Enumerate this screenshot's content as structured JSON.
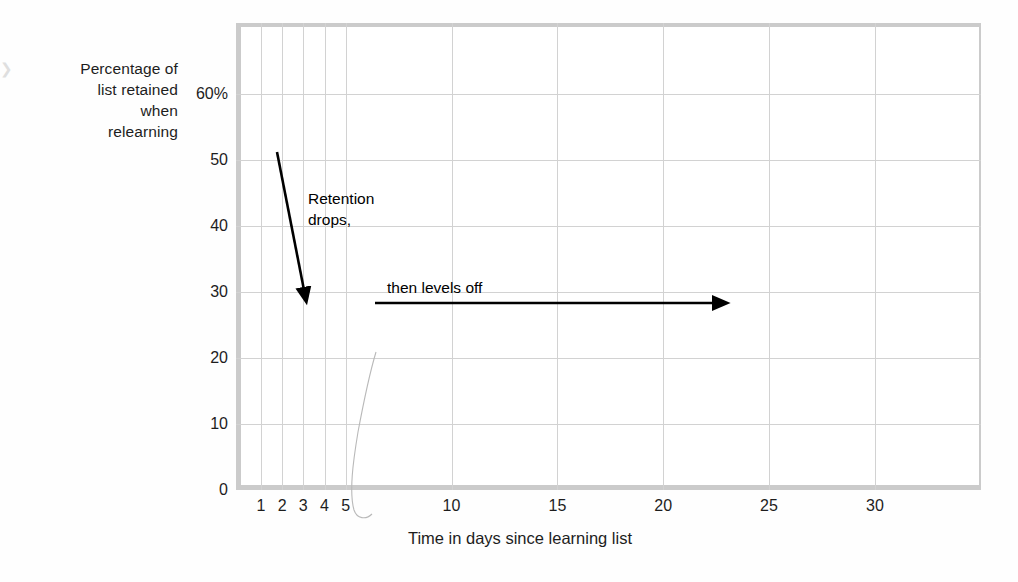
{
  "chart_data": {
    "type": "line",
    "title": "",
    "xlabel": "Time in days since learning list",
    "ylabel": "Percentage of list retained when relearning",
    "ylabel_lines": [
      "Percentage of",
      "list retained",
      "when",
      "relearning"
    ],
    "xlim": [
      0,
      35
    ],
    "ylim": [
      0,
      63
    ],
    "grid": true,
    "legend": "none",
    "xticks": [
      {
        "value": 1,
        "label": "1"
      },
      {
        "value": 2,
        "label": "2"
      },
      {
        "value": 3,
        "label": "3"
      },
      {
        "value": 4,
        "label": "4"
      },
      {
        "value": 5,
        "label": "5"
      },
      {
        "value": 10,
        "label": "10"
      },
      {
        "value": 15,
        "label": "15"
      },
      {
        "value": 20,
        "label": "20"
      },
      {
        "value": 25,
        "label": "25"
      },
      {
        "value": 30,
        "label": "30"
      }
    ],
    "yticks": [
      {
        "value": 0,
        "label": "0"
      },
      {
        "value": 10,
        "label": "10"
      },
      {
        "value": 20,
        "label": "20"
      },
      {
        "value": 30,
        "label": "30"
      },
      {
        "value": 40,
        "label": "40"
      },
      {
        "value": 50,
        "label": "50"
      },
      {
        "value": 60,
        "label": "60%"
      }
    ],
    "series": [
      {
        "name": "Percentage of list retained when relearning",
        "color": "#a8a8a8",
        "x": [
          0.35,
          0.35,
          1.1,
          3.1,
          29.4
        ],
        "y": [
          58.5,
          58.5,
          29.5,
          25.0,
          21.0
        ],
        "points": [
          {
            "day": 0.35,
            "percent": 58.5
          },
          {
            "day": 1.1,
            "percent": 29.5
          },
          {
            "day": 3.1,
            "percent": 25.0
          },
          {
            "day": 29.4,
            "percent": 21.0
          }
        ]
      }
    ],
    "annotations": [
      {
        "id": "retention-drops",
        "text_lines": [
          "Retention",
          "drops,"
        ],
        "arrow": "down-right-to-down",
        "arrow_from": {
          "day": 1.6,
          "percent": 48.5
        },
        "arrow_to": {
          "day": 3.2,
          "percent": 27.5
        }
      },
      {
        "id": "then-levels-off",
        "text_lines": [
          "then levels off"
        ],
        "arrow": "right",
        "arrow_from": {
          "day": 6.6,
          "percent": 28.5
        },
        "arrow_to": {
          "day": 23.4,
          "percent": 28.5
        }
      }
    ],
    "colors": {
      "line": "#a8a8a8",
      "grid": "#d2d2d2",
      "frame": "#cbcbcb",
      "text": "#1d1d1d",
      "annotation": "#000000",
      "background": "#ffffff"
    }
  }
}
